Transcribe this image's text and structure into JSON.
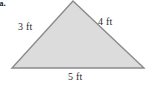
{
  "figure": {
    "item_marker": "a.",
    "background_color": "#ffffff",
    "shape": {
      "name": "triangle",
      "type": "scalene",
      "fill_color": "#dcdcdc",
      "stroke_color": "#8a8a8a",
      "stroke_width": 1.4,
      "vertices": [
        {
          "name": "apex",
          "x": 73,
          "y": 1
        },
        {
          "name": "bottom-right",
          "x": 144,
          "y": 68
        },
        {
          "name": "bottom-left",
          "x": 12,
          "y": 68
        }
      ]
    },
    "labels": [
      {
        "id": "left",
        "text": "3 ft",
        "side": "left",
        "x": 18,
        "y": 21
      },
      {
        "id": "right",
        "text": "4 ft",
        "side": "right",
        "x": 98,
        "y": 16
      },
      {
        "id": "base",
        "text": "5 ft",
        "side": "bottom",
        "x": 68,
        "y": 71
      }
    ],
    "measurements": {
      "left_side": "3 ft",
      "right_side": "4 ft",
      "base": "5 ft"
    }
  }
}
